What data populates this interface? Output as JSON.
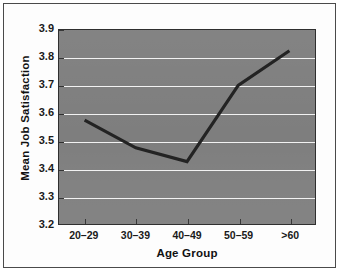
{
  "chart_data": {
    "type": "line",
    "title": "",
    "xlabel": "Age Group",
    "ylabel": "Mean Job Satisfaction",
    "categories": [
      "20–29",
      "30–39",
      "40–49",
      "50–59",
      ">60"
    ],
    "values": [
      3.575,
      3.475,
      3.425,
      3.7,
      3.825
    ],
    "series": [
      {
        "name": "Mean Job Satisfaction",
        "values": [
          3.575,
          3.475,
          3.425,
          3.7,
          3.825
        ]
      }
    ],
    "ylim": [
      3.2,
      3.9
    ],
    "yticks": [
      3.2,
      3.3,
      3.4,
      3.5,
      3.6,
      3.7,
      3.8,
      3.9
    ],
    "ytick_labels": [
      "3.2",
      "3.3",
      "3.4",
      "3.5",
      "3.6",
      "3.7",
      "3.8",
      "3.9"
    ],
    "grid": "horizontal",
    "legend": "none",
    "colors": {
      "plot_background": "#7e7e7e",
      "gridline": "#f2f2f2",
      "series_line": "#232323",
      "axis": "#2f2f2f",
      "text": "#111111",
      "figure_background": "#fdfdfd",
      "figure_border": "#4a4a4a"
    }
  }
}
